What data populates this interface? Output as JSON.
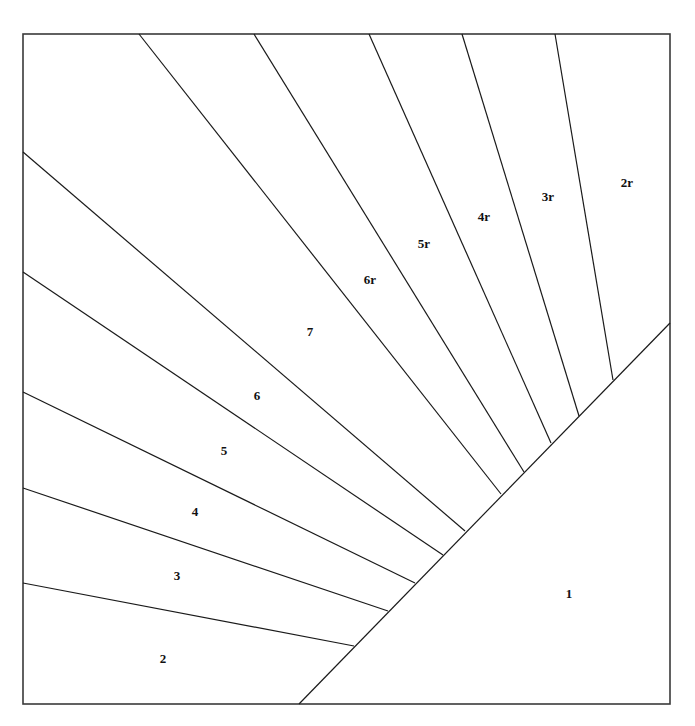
{
  "diagram": {
    "type": "foundation-piecing-pattern",
    "frame": {
      "x1": 23,
      "y1": 34,
      "x2": 670,
      "y2": 704,
      "stroke": "#3a3a3a"
    },
    "baseline": {
      "from": [
        299,
        704
      ],
      "to": [
        670,
        323
      ]
    },
    "seams": [
      {
        "from": [
          23,
          583
        ],
        "to": [
          354,
          646
        ]
      },
      {
        "from": [
          23,
          488
        ],
        "to": [
          388,
          611
        ]
      },
      {
        "from": [
          23,
          392
        ],
        "to": [
          415,
          583
        ]
      },
      {
        "from": [
          23,
          272
        ],
        "to": [
          443,
          555
        ]
      },
      {
        "from": [
          23,
          152
        ],
        "to": [
          465,
          531
        ]
      },
      {
        "from": [
          139,
          34
        ],
        "to": [
          501,
          494
        ]
      },
      {
        "from": [
          254,
          34
        ],
        "to": [
          524,
          472
        ]
      },
      {
        "from": [
          369,
          34
        ],
        "to": [
          551,
          443
        ]
      },
      {
        "from": [
          462,
          34
        ],
        "to": [
          579,
          416
        ]
      },
      {
        "from": [
          555,
          34
        ],
        "to": [
          613,
          380
        ]
      }
    ],
    "pieces": [
      {
        "label": "1",
        "x": 569,
        "y": 598
      },
      {
        "label": "2",
        "x": 163,
        "y": 663
      },
      {
        "label": "3",
        "x": 177,
        "y": 580
      },
      {
        "label": "4",
        "x": 195,
        "y": 516
      },
      {
        "label": "5",
        "x": 224,
        "y": 455
      },
      {
        "label": "6",
        "x": 257,
        "y": 400
      },
      {
        "label": "7",
        "x": 310,
        "y": 336
      },
      {
        "label": "6r",
        "x": 370,
        "y": 284
      },
      {
        "label": "5r",
        "x": 424,
        "y": 248
      },
      {
        "label": "4r",
        "x": 484,
        "y": 221
      },
      {
        "label": "3r",
        "x": 548,
        "y": 201
      },
      {
        "label": "2r",
        "x": 627,
        "y": 187
      }
    ]
  }
}
